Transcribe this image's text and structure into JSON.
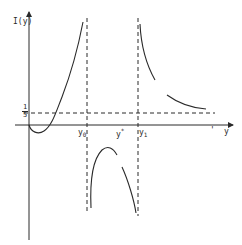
{
  "figure": {
    "y_axis_label": "I(y)",
    "x_axis_label": "y",
    "level_numerator": "1",
    "level_denominator": "5",
    "markers": [
      {
        "id": "y0",
        "base": "y",
        "sub": "0"
      },
      {
        "id": "ystar",
        "base": "y",
        "sup": "*"
      },
      {
        "id": "y1",
        "base": "y",
        "sub": "1"
      }
    ],
    "stray_mark": "'",
    "colors": {
      "ink": "#2a2a2a",
      "background": "#ffffff"
    }
  }
}
